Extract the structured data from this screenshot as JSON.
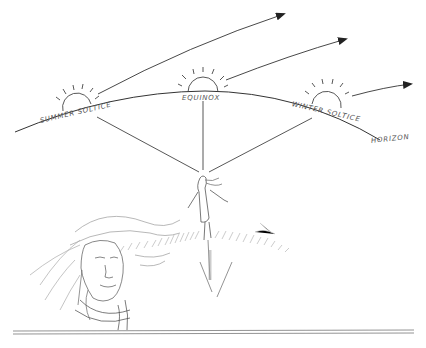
{
  "diagram": {
    "labels": {
      "summer": "SUMMER SOLTICE",
      "equinox": "EQUINOX",
      "winter": "WINTER SOLTICE",
      "horizon": "HORIZON"
    },
    "colors": {
      "ink": "#333333",
      "light_ink": "#888888",
      "background": "#ffffff"
    }
  }
}
